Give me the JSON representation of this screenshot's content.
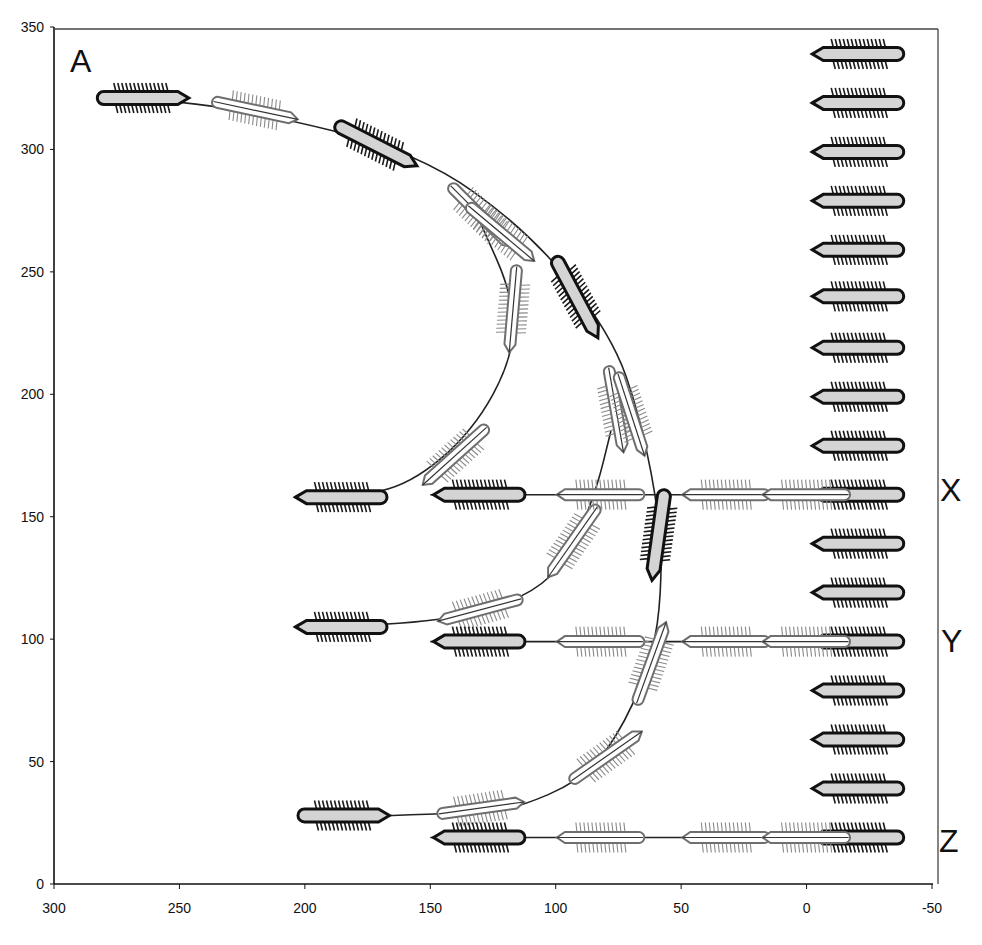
{
  "figure": {
    "panel_label": "A",
    "row_labels": [
      {
        "label": "X",
        "y": 159
      },
      {
        "label": "Y",
        "y": 99
      },
      {
        "label": "Z",
        "y": 19
      }
    ]
  },
  "chart_data": {
    "type": "diagram",
    "title": "",
    "xlabel": "",
    "ylabel": "",
    "xlim": [
      300,
      -50
    ],
    "ylim": [
      0,
      350
    ],
    "x_axis_reversed": true,
    "x_ticks": [
      300,
      250,
      200,
      150,
      100,
      50,
      0,
      -50
    ],
    "y_ticks": [
      0,
      50,
      100,
      150,
      200,
      250,
      300,
      350
    ],
    "grid": false,
    "colors": {
      "dark_outline": "#111111",
      "cell_fill": "#d4d4d4",
      "ghost_outline": "#7a7a7a",
      "ghost_fill": "#ffffff",
      "path": "#222222"
    },
    "stationary_column": {
      "x": -21,
      "heading": "left",
      "style": "dark",
      "y_values": [
        339,
        319,
        299,
        279,
        259,
        240,
        219,
        199,
        179,
        159,
        139,
        119,
        99,
        79,
        59,
        39,
        19
      ]
    },
    "trajectories": [
      {
        "name": "A-path",
        "points": [
          [
            265,
            321
          ],
          [
            222,
            316
          ],
          [
            155,
            299
          ],
          [
            110,
            266
          ],
          [
            78,
            225
          ],
          [
            66,
            190
          ],
          [
            58,
            146
          ],
          [
            58,
            118
          ],
          [
            61,
            95
          ],
          [
            72,
            66
          ],
          [
            88,
            43
          ],
          [
            118,
            30
          ],
          [
            135,
            29
          ],
          [
            195,
            27
          ]
        ],
        "cells": [
          {
            "x": 265,
            "y": 321,
            "angle": 0,
            "style": "dark"
          },
          {
            "x": 220,
            "y": 316,
            "angle": -12,
            "style": "ghost"
          },
          {
            "x": 172,
            "y": 302,
            "angle": -27,
            "style": "dark"
          },
          {
            "x": 130,
            "y": 273,
            "angle": -45,
            "style": "ghost"
          },
          {
            "x": 122,
            "y": 266,
            "angle": -40,
            "style": "ghost"
          },
          {
            "x": 92,
            "y": 240,
            "angle": -62,
            "style": "dark"
          },
          {
            "x": 76,
            "y": 194,
            "angle": -80,
            "style": "ghost"
          },
          {
            "x": 70,
            "y": 192,
            "angle": -72,
            "style": "ghost"
          },
          {
            "x": 59,
            "y": 143,
            "angle": -98,
            "style": "dark"
          },
          {
            "x": 62,
            "y": 90,
            "angle": 70,
            "style": "ghost"
          },
          {
            "x": 80,
            "y": 52,
            "angle": 35,
            "style": "ghost"
          },
          {
            "x": 130,
            "y": 31,
            "angle": 8,
            "style": "ghost"
          },
          {
            "x": 185,
            "y": 28,
            "angle": 0,
            "style": "dark"
          }
        ]
      },
      {
        "name": "upper-loop",
        "points": [
          [
            130,
            270
          ],
          [
            117,
            240
          ],
          [
            117,
            215
          ],
          [
            133,
            185
          ],
          [
            158,
            163
          ],
          [
            182,
            158
          ]
        ],
        "cells": [
          {
            "x": 117,
            "y": 235,
            "angle": -95,
            "style": "ghost"
          },
          {
            "x": 140,
            "y": 175,
            "angle": -138,
            "style": "ghost"
          },
          {
            "x": 185,
            "y": 158,
            "angle": 180,
            "style": "dark",
            "heading": "left"
          }
        ]
      },
      {
        "name": "middle-loop",
        "points": [
          [
            78,
            185
          ],
          [
            84,
            160
          ],
          [
            95,
            133
          ],
          [
            110,
            118
          ],
          [
            140,
            108
          ],
          [
            185,
            105
          ]
        ],
        "cells": [
          {
            "x": 93,
            "y": 140,
            "angle": -125,
            "style": "ghost"
          },
          {
            "x": 130,
            "y": 112,
            "angle": -165,
            "style": "ghost"
          },
          {
            "x": 185,
            "y": 105,
            "angle": 180,
            "style": "dark",
            "heading": "left"
          }
        ]
      },
      {
        "name": "row-X",
        "y": 159,
        "cells": [
          {
            "x": 130,
            "y": 159,
            "style": "dark",
            "heading": "left"
          },
          {
            "x": 82,
            "y": 159,
            "style": "ghost"
          },
          {
            "x": 32,
            "y": 159,
            "style": "ghost"
          },
          {
            "x": 0,
            "y": 159,
            "style": "ghost"
          }
        ]
      },
      {
        "name": "row-Y",
        "y": 99,
        "cells": [
          {
            "x": 130,
            "y": 99,
            "style": "dark",
            "heading": "left"
          },
          {
            "x": 82,
            "y": 99,
            "style": "ghost"
          },
          {
            "x": 32,
            "y": 99,
            "style": "ghost"
          },
          {
            "x": 0,
            "y": 99,
            "style": "ghost"
          }
        ]
      },
      {
        "name": "row-Z",
        "y": 19,
        "cells": [
          {
            "x": 130,
            "y": 19,
            "style": "dark",
            "heading": "left"
          },
          {
            "x": 82,
            "y": 19,
            "style": "ghost"
          },
          {
            "x": 32,
            "y": 19,
            "style": "ghost"
          },
          {
            "x": 0,
            "y": 19,
            "style": "ghost"
          }
        ]
      }
    ]
  }
}
